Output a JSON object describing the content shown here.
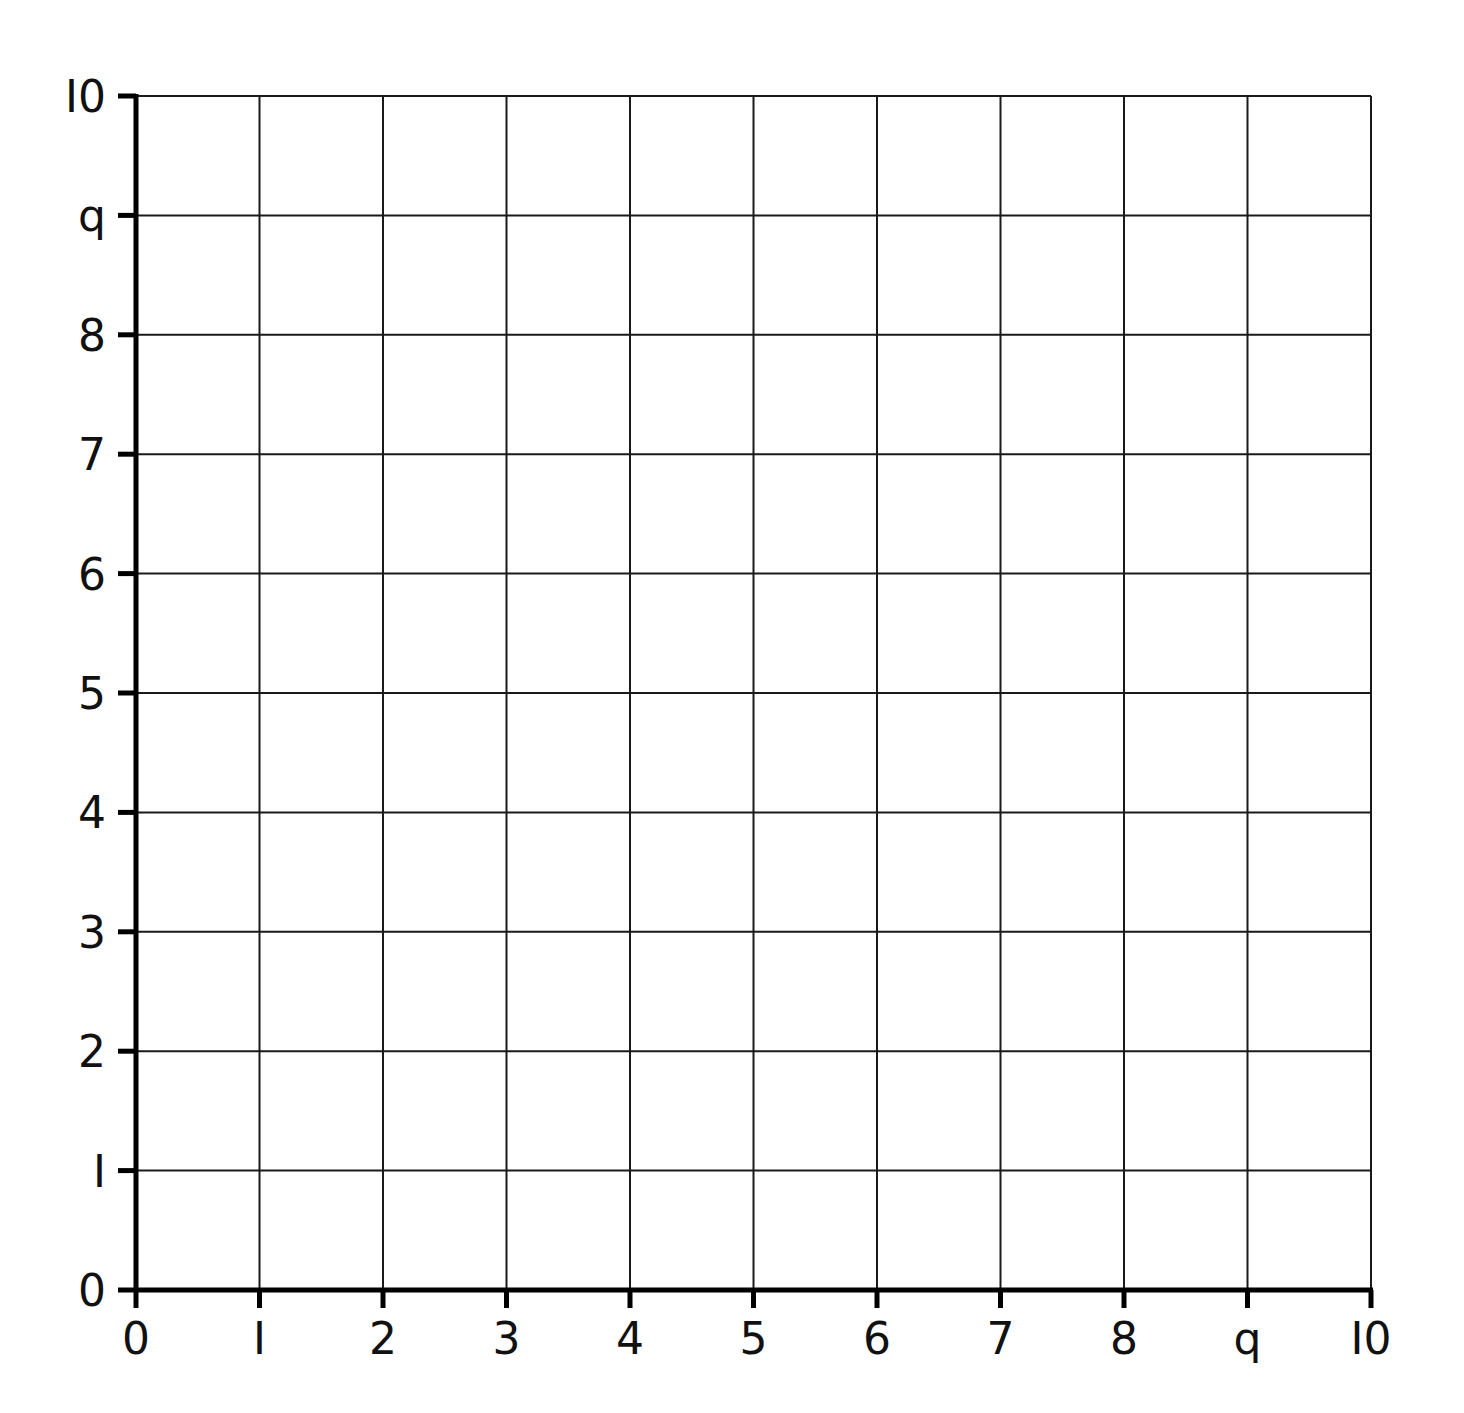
{
  "chart_data": {
    "type": "scatter",
    "title": "",
    "xlabel": "",
    "ylabel": "",
    "x": [],
    "y": [],
    "series": [],
    "xlim": [
      0,
      10
    ],
    "ylim": [
      0,
      10
    ],
    "grid": true,
    "legend": "none",
    "x_ticks": [
      "0",
      "1",
      "2",
      "3",
      "4",
      "5",
      "6",
      "7",
      "8",
      "9",
      "10"
    ],
    "y_ticks": [
      "0",
      "1",
      "2",
      "3",
      "4",
      "5",
      "6",
      "7",
      "8",
      "9",
      "10"
    ],
    "note": "Blank 10x10 coordinate grid with labeled axes"
  },
  "colors": {
    "grid": "#1a1a1a",
    "axis": "#000000",
    "background": "#ffffff"
  }
}
